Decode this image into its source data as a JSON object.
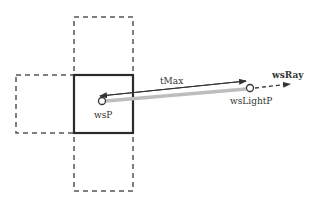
{
  "diagram": {
    "type": "light-ray-cell-traversal",
    "colors": {
      "background": "#ffffff",
      "solid_cell": "#2b2b2b",
      "dashed_cell": "#555555",
      "tmax_arrow": "#333333",
      "light_segment": "#bdbdbd",
      "ray_dashed": "#333333",
      "text": "#333333"
    },
    "cells": {
      "center": {
        "label": "",
        "style": "solid"
      },
      "top": {
        "style": "dashed"
      },
      "left": {
        "style": "dashed"
      },
      "bottom": {
        "style": "dashed"
      }
    },
    "points": {
      "wsP": {
        "label": "wsP"
      },
      "wsLightP": {
        "label": "wsLightP"
      }
    },
    "labels": {
      "tmax": "tMax",
      "ws_ray": "wsRay",
      "ws_p": "wsP",
      "ws_light_p": "wsLightP"
    }
  }
}
